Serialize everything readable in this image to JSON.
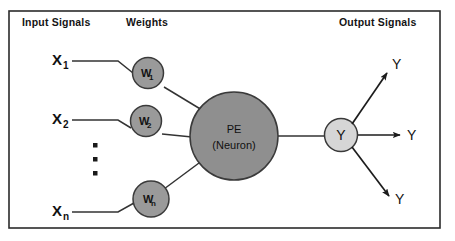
{
  "figure": {
    "kind": "artificial-neuron-diagram",
    "frame": {
      "border_color": "#2b2b2b",
      "background": "#ffffff"
    }
  },
  "headers": {
    "input": "Input Signals",
    "weights": "Weights",
    "output": "Output Signals"
  },
  "inputs": [
    {
      "base": "X",
      "sub": "1"
    },
    {
      "base": "X",
      "sub": "2"
    },
    {
      "base": "X",
      "sub": "n"
    }
  ],
  "ellipsis": {
    "glyph": "▪",
    "count": 3
  },
  "weights": [
    {
      "base": "W",
      "sub": "1",
      "fill": "#9a9a9a"
    },
    {
      "base": "W",
      "sub": "2",
      "fill": "#9a9a9a"
    },
    {
      "base": "W",
      "sub": "n",
      "fill": "#9a9a9a"
    }
  ],
  "processing_element": {
    "line1": "PE",
    "line2": "(Neuron)",
    "fill": "#8f8f8f"
  },
  "output_node": {
    "label": "Y",
    "fill": "#d6d6d6"
  },
  "output_signals": [
    {
      "label": "Y",
      "direction": "up-right"
    },
    {
      "label": "Y",
      "direction": "right"
    },
    {
      "label": "Y",
      "direction": "down-right"
    }
  ],
  "colors": {
    "line": "#333333",
    "text": "#111111",
    "frame": "#2b2b2b",
    "weight_fill": "#9a9a9a",
    "pe_fill": "#8f8f8f",
    "out_fill": "#d6d6d6"
  }
}
